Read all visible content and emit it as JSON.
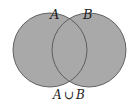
{
  "diagram": {
    "type": "venn",
    "sets": [
      {
        "label": "A",
        "cx": 50,
        "cy": 50,
        "r": 37
      },
      {
        "label": "B",
        "cx": 89,
        "cy": 50,
        "r": 37
      }
    ],
    "caption": "A ∪ B",
    "caption_parts": {
      "left": "A",
      "op": "∪",
      "right": "B"
    },
    "colors": {
      "fill": "#a9a9a9",
      "stroke": "#555555",
      "background": "#ffffff"
    }
  }
}
